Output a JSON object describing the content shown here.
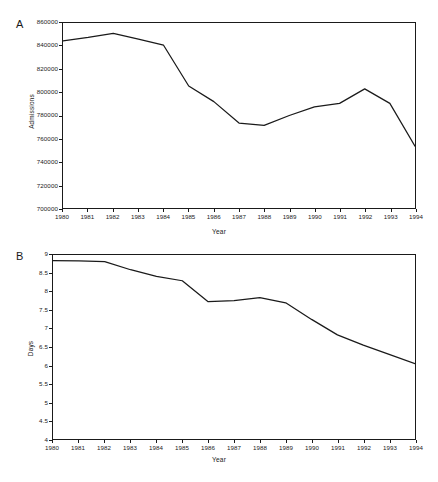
{
  "figure": {
    "caption": ""
  },
  "chart_data": [
    {
      "panel": "A",
      "type": "line",
      "title": "",
      "xlabel": "Year",
      "ylabel": "Admissions",
      "x": [
        1980,
        1981,
        1982,
        1983,
        1984,
        1985,
        1986,
        1987,
        1988,
        1989,
        1990,
        1991,
        1992,
        1993,
        1994
      ],
      "values": [
        844500,
        847500,
        851000,
        846000,
        840800,
        805500,
        792000,
        773500,
        771500,
        780000,
        787500,
        790500,
        803000,
        790500,
        753500
      ],
      "categories": [
        "1980",
        "1981",
        "1982",
        "1983",
        "1984",
        "1985",
        "1986",
        "1987",
        "1988",
        "1989",
        "1990",
        "1991",
        "1992",
        "1993",
        "1994"
      ],
      "xticklabels": [
        "1980",
        "1981",
        "1982",
        "1983",
        "1984",
        "1985",
        "1986",
        "1987",
        "1988",
        "1989",
        "1990",
        "1991",
        "1992",
        "1993",
        "1994"
      ],
      "yticklabels": [
        "700000",
        "720000",
        "740000",
        "760000",
        "780000",
        "800000",
        "820000",
        "840000",
        "860000"
      ],
      "ytickvalues": [
        700000,
        720000,
        740000,
        760000,
        780000,
        800000,
        820000,
        840000,
        860000
      ],
      "ylim": [
        700000,
        860000
      ],
      "xlim": [
        1980,
        1994
      ],
      "grid": false,
      "legend": false,
      "line_color": "#1a1a1a"
    },
    {
      "panel": "B",
      "type": "line",
      "title": "",
      "xlabel": "Year",
      "ylabel": "Days",
      "x": [
        1980,
        1981,
        1982,
        1983,
        1984,
        1985,
        1986,
        1987,
        1988,
        1989,
        1990,
        1991,
        1992,
        1993,
        1994
      ],
      "values": [
        8.85,
        8.84,
        8.82,
        8.6,
        8.42,
        8.3,
        7.73,
        7.76,
        7.84,
        7.7,
        7.25,
        6.83,
        6.55,
        6.3,
        6.05
      ],
      "categories": [
        "1980",
        "1981",
        "1982",
        "1983",
        "1984",
        "1985",
        "1986",
        "1987",
        "1988",
        "1989",
        "1990",
        "1991",
        "1992",
        "1993",
        "1994"
      ],
      "xticklabels": [
        "1980",
        "1981",
        "1982",
        "1983",
        "1984",
        "1985",
        "1986",
        "1987",
        "1988",
        "1989",
        "1990",
        "1991",
        "1992",
        "1993",
        "1994"
      ],
      "yticklabels": [
        "4",
        "4.5",
        "5",
        "5.5",
        "6",
        "6.5",
        "7",
        "7.5",
        "8",
        "8.5",
        "9"
      ],
      "ytickvalues": [
        4,
        4.5,
        5,
        5.5,
        6,
        6.5,
        7,
        7.5,
        8,
        8.5,
        9
      ],
      "ylim": [
        4,
        9
      ],
      "xlim": [
        1980,
        1994
      ],
      "grid": false,
      "legend": false,
      "line_color": "#1a1a1a"
    }
  ],
  "panels": {
    "a": {
      "letter": "A"
    },
    "b": {
      "letter": "B"
    }
  }
}
